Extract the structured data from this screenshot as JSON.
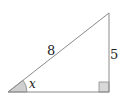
{
  "diagram": {
    "type": "right-triangle",
    "hypotenuse_label": "8",
    "opposite_side_label": "5",
    "angle_label": "x",
    "right_angle_marker": true,
    "colors": {
      "stroke": "#8a8a8a",
      "angle_fill": "#cfcfcf",
      "right_angle_fill": "#d8d8d8",
      "text": "#222222"
    }
  }
}
